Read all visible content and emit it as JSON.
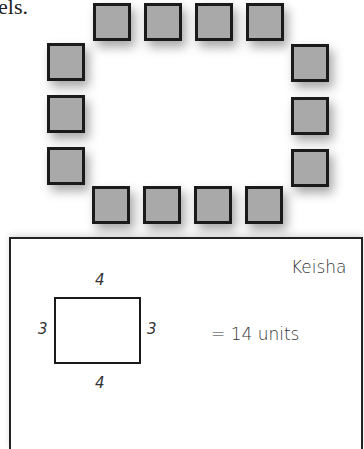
{
  "text_fragment": "els.",
  "tile_arrangement": {
    "tile_color": "#a9a9a9",
    "border_color": "#1a1a1a",
    "tile_count": 14,
    "top_row": [
      {
        "x": 93,
        "y": 3
      },
      {
        "x": 144,
        "y": 3
      },
      {
        "x": 195,
        "y": 3
      },
      {
        "x": 246,
        "y": 3
      }
    ],
    "left_column": [
      {
        "x": 47,
        "y": 43
      },
      {
        "x": 47,
        "y": 95
      },
      {
        "x": 47,
        "y": 147
      }
    ],
    "right_column": [
      {
        "x": 291,
        "y": 44
      },
      {
        "x": 291,
        "y": 97
      },
      {
        "x": 291,
        "y": 149
      }
    ],
    "bottom_row": [
      {
        "x": 92,
        "y": 186
      },
      {
        "x": 143,
        "y": 186
      },
      {
        "x": 194,
        "y": 186
      },
      {
        "x": 245,
        "y": 186
      }
    ]
  },
  "student_work": {
    "name": "Keisha",
    "rectangle": {
      "top_label": "4",
      "bottom_label": "4",
      "left_label": "3",
      "right_label": "3"
    },
    "result": "= 14 units"
  }
}
